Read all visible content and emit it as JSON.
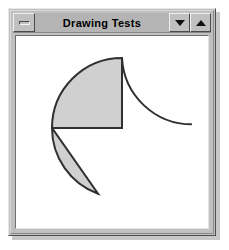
{
  "window": {
    "title": "Drawing Tests",
    "system_menu_icon": "minimize-bar-icon",
    "minimize_icon": "triangle-down-icon",
    "maximize_icon": "triangle-up-icon",
    "frame_color": "#c0c0c0",
    "titlebar_color": "#b4b4b4",
    "client_color": "#ffffff"
  },
  "canvas": {
    "width": 196,
    "height": 198,
    "background": "#ffffff",
    "shape_fill": "#d0d0d0",
    "shape_outline": "#303030",
    "outline_width": 2,
    "center": {
      "x": 106,
      "y": 92
    },
    "radius": 70,
    "shapes": [
      {
        "name": "pie-slice",
        "type": "pie",
        "start_angle_deg": 90,
        "end_angle_deg": 180,
        "filled": true,
        "fill": "#d0d0d0",
        "stroke": "#303030"
      },
      {
        "name": "arc-stroke",
        "type": "arc",
        "start_angle_deg": 90,
        "end_angle_deg": 3,
        "filled": false,
        "stroke": "#303030"
      },
      {
        "name": "chord-segment",
        "type": "chord",
        "start_angle_deg": 180,
        "end_angle_deg": 250,
        "filled": true,
        "fill": "#d0d0d0",
        "stroke": "#303030"
      }
    ]
  }
}
